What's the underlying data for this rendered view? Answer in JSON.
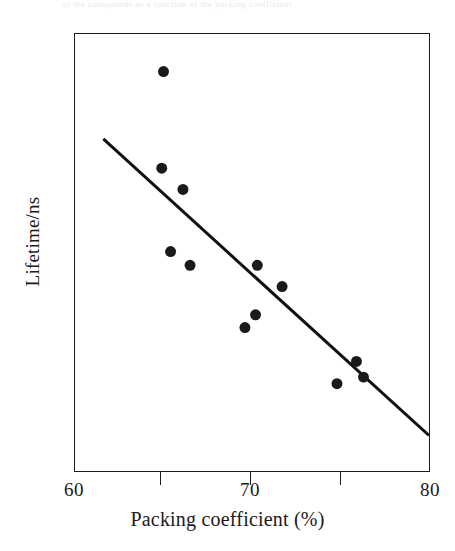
{
  "figure": {
    "caption_remnant": "of the compounds as a function of the packing coefficient",
    "background_color": "#ffffff",
    "ink_color": "#1d1d1d"
  },
  "axes": {
    "x": {
      "title": "Packing coefficient (%)",
      "min": 60,
      "max": 80,
      "scale": "linear",
      "major_ticks": [
        60,
        70,
        80
      ],
      "minor_ticks": [
        65,
        75
      ],
      "tick_labels": [
        "60",
        "70",
        "80"
      ],
      "tick_label_values": [
        60,
        70,
        80
      ]
    },
    "y": {
      "title": "Lifetime/ns",
      "min": 0.5,
      "max": 3.1,
      "scale": "log",
      "major_ticks": [
        2,
        1
      ],
      "minor_ticks": [
        1.41,
        0.707
      ],
      "tick_labels": [
        "2",
        "1"
      ],
      "tick_label_values": [
        2,
        1
      ]
    },
    "grid": false,
    "frame": true
  },
  "chart_data": {
    "type": "scatter",
    "title": "",
    "xlabel": "Packing coefficient (%)",
    "ylabel": "Lifetime/ns",
    "xlim": [
      60,
      80
    ],
    "ylim": [
      0.5,
      3.1
    ],
    "yscale": "log",
    "xscale": "linear",
    "grid": false,
    "legend": "none",
    "marker": {
      "shape": "filled-circle",
      "color": "#1a1a1a",
      "size_px": 11
    },
    "points": [
      {
        "x": 65.0,
        "y": 2.65
      },
      {
        "x": 64.9,
        "y": 1.77
      },
      {
        "x": 66.1,
        "y": 1.62
      },
      {
        "x": 65.4,
        "y": 1.25
      },
      {
        "x": 66.5,
        "y": 1.18
      },
      {
        "x": 70.3,
        "y": 1.18
      },
      {
        "x": 71.7,
        "y": 1.08
      },
      {
        "x": 70.2,
        "y": 0.96
      },
      {
        "x": 69.6,
        "y": 0.91
      },
      {
        "x": 75.9,
        "y": 0.79
      },
      {
        "x": 76.3,
        "y": 0.74
      },
      {
        "x": 74.8,
        "y": 0.72
      }
    ],
    "series": [
      {
        "name": "Lifetime data",
        "type": "scatter",
        "x": [
          65.0,
          64.9,
          66.1,
          65.4,
          66.5,
          70.3,
          71.7,
          70.2,
          69.6,
          75.9,
          76.3,
          74.8
        ],
        "values": [
          2.65,
          1.77,
          1.62,
          1.25,
          1.18,
          1.18,
          1.08,
          0.96,
          0.91,
          0.79,
          0.74,
          0.72
        ]
      },
      {
        "name": "Trend line",
        "type": "line",
        "color": "#111111",
        "width_px": 3,
        "x": [
          61.6,
          80.0
        ],
        "values": [
          2.0,
          0.58
        ]
      }
    ],
    "annotations": []
  }
}
